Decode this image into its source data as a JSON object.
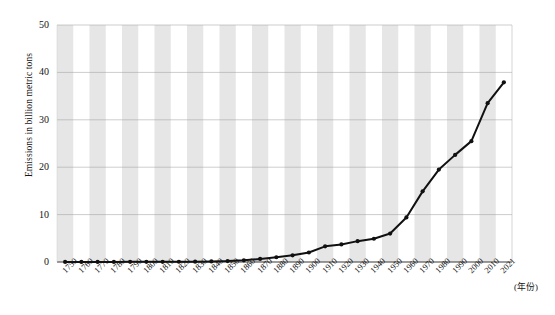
{
  "axes": {
    "ylabel": "Emissions in billion metric tons",
    "xunit": "(年份)",
    "yticks": [
      "0",
      "10",
      "20",
      "30",
      "40",
      "50"
    ],
    "ylim": [
      0,
      50
    ],
    "grid": "horizontal gridlines at every 10 units; alternating vertical shaded bands per category"
  },
  "caption": "",
  "colors": {
    "line": "#111111",
    "marker": "#111111",
    "band": "#e6e6e6",
    "gridline": "#9a9a9a",
    "axis": "#3a3a3a",
    "background": "#ffffff"
  },
  "chart_data": {
    "type": "line",
    "title": "",
    "xlabel": "(年份)",
    "ylabel": "Emissions in billion metric tons",
    "ylim": [
      0,
      50
    ],
    "yticks": [
      0,
      10,
      20,
      30,
      40,
      50
    ],
    "grid": true,
    "legend": "none",
    "categories": [
      "1750",
      "1760",
      "1770",
      "1780",
      "1790",
      "1800",
      "1810",
      "1820",
      "1830",
      "1840",
      "1850",
      "1860",
      "1870",
      "1880",
      "1890",
      "1900",
      "1910",
      "1920",
      "1930",
      "1940",
      "1950",
      "1960",
      "1970",
      "1980",
      "1990",
      "2000",
      "2010",
      "2021"
    ],
    "values": [
      0.01,
      0.01,
      0.01,
      0.02,
      0.03,
      0.03,
      0.04,
      0.05,
      0.07,
      0.12,
      0.2,
      0.36,
      0.65,
      1.0,
      1.4,
      2.0,
      3.3,
      3.7,
      4.4,
      4.9,
      6.0,
      9.4,
      14.9,
      19.5,
      22.6,
      25.5,
      33.5,
      37.9
    ]
  }
}
